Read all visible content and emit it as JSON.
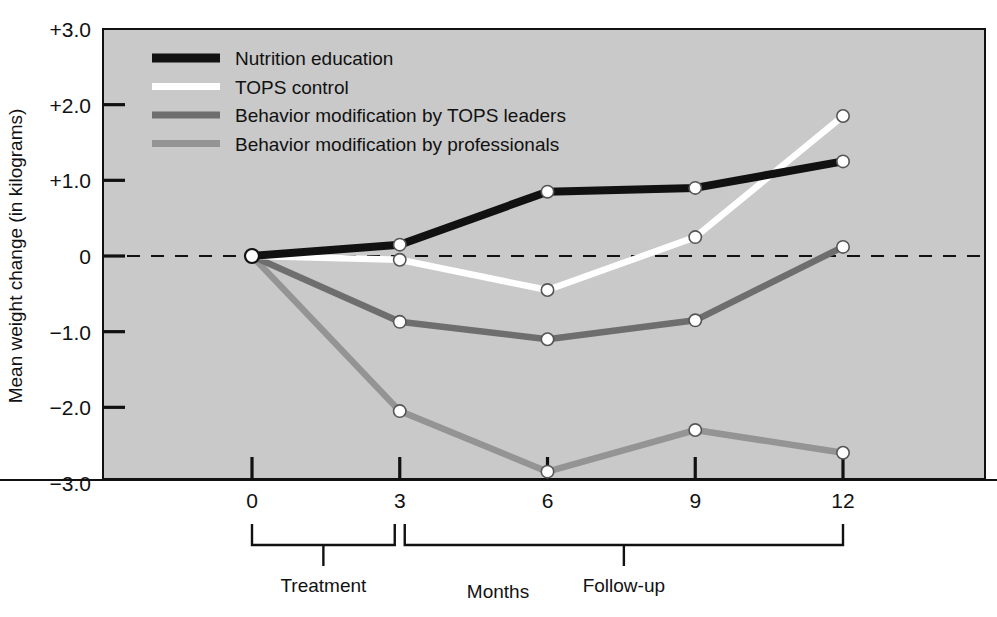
{
  "chart_data": {
    "type": "line",
    "title": "",
    "xlabel": "Months",
    "ylabel": "Mean weight change (in kilograms)",
    "x": [
      0,
      3,
      6,
      9,
      12
    ],
    "xtick_labels": [
      "0",
      "3",
      "6",
      "9",
      "12"
    ],
    "ytick_labels": [
      "+3.0",
      "+2.0",
      "+1.0",
      "0",
      "−1.0",
      "−2.0",
      "−3.0"
    ],
    "ytick_values": [
      3.0,
      2.0,
      1.0,
      0,
      -1.0,
      -2.0,
      -3.0
    ],
    "xlim": [
      -1.7,
      9.6
    ],
    "ylim": [
      -3.0,
      3.0
    ],
    "grid": false,
    "zero_reference_line": true,
    "legend_position": "top-left inside plot",
    "series": [
      {
        "name": "Nutrition education",
        "color": "#111111",
        "values": [
          0.0,
          0.15,
          0.85,
          0.9,
          1.25
        ]
      },
      {
        "name": "TOPS control",
        "color": "#ffffff",
        "values": [
          0.0,
          -0.05,
          -0.45,
          0.25,
          1.85
        ]
      },
      {
        "name": "Behavior modification by TOPS leaders",
        "color": "#6e6e6e",
        "values": [
          0.0,
          -0.87,
          -1.1,
          -0.85,
          0.12
        ]
      },
      {
        "name": "Behavior modification by professionals",
        "color": "#949494",
        "values": [
          0.0,
          -2.05,
          -2.85,
          -2.3,
          -2.6
        ]
      }
    ],
    "brackets": [
      {
        "label": "Treatment",
        "from": 0,
        "to": 3
      },
      {
        "label": "Follow-up",
        "from": 3,
        "to": 12
      }
    ]
  },
  "style": {
    "plot_background": "#c9c9c9",
    "page_background": "#ffffff",
    "axis_color": "#111111",
    "marker_fill": "#ffffff",
    "marker_stroke": "#555555"
  }
}
